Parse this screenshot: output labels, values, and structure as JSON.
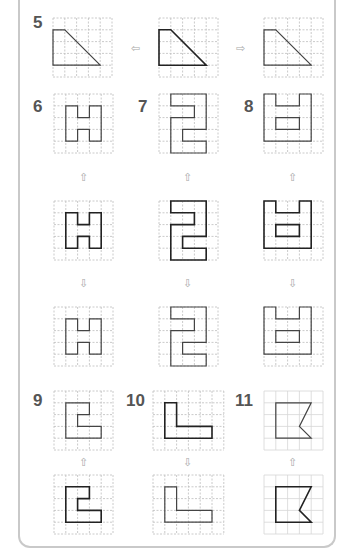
{
  "colors": {
    "frame": "#c9c9c9",
    "grid": "#bdbdbd",
    "shape": "#444444",
    "shape_bold": "#222222",
    "arrow": "#a8a8a8",
    "number": "#555555"
  },
  "problems": [
    {
      "number": "5",
      "x": 33,
      "y": 14
    },
    {
      "number": "6",
      "x": 33,
      "y": 98
    },
    {
      "number": "7",
      "x": 138,
      "y": 98
    },
    {
      "number": "8",
      "x": 244,
      "y": 98
    },
    {
      "number": "9",
      "x": 33,
      "y": 392
    },
    {
      "number": "10",
      "x": 126,
      "y": 392
    },
    {
      "number": "11",
      "x": 235,
      "y": 392
    }
  ],
  "grids": [
    {
      "id": "p5-left",
      "x": 53,
      "y": 18,
      "cols": 5,
      "rows": 5,
      "style": "dashed",
      "bold": false,
      "points": [
        [
          0,
          1
        ],
        [
          1,
          1
        ],
        [
          4,
          4
        ],
        [
          0,
          4
        ]
      ]
    },
    {
      "id": "p5-center",
      "x": 159,
      "y": 18,
      "cols": 5,
      "rows": 5,
      "style": "dashed",
      "bold": true,
      "points": [
        [
          0,
          1
        ],
        [
          1,
          1
        ],
        [
          4,
          4
        ],
        [
          0,
          4
        ]
      ]
    },
    {
      "id": "p5-right",
      "x": 264,
      "y": 18,
      "cols": 5,
      "rows": 5,
      "style": "dashed",
      "bold": false,
      "points": [
        [
          0,
          1
        ],
        [
          1,
          1
        ],
        [
          4,
          4
        ],
        [
          0,
          4
        ]
      ]
    },
    {
      "id": "p6-top",
      "x": 54,
      "y": 94,
      "cols": 5,
      "rows": 5,
      "style": "dashed",
      "bold": false,
      "points": [
        [
          1,
          1
        ],
        [
          2,
          1
        ],
        [
          2,
          2
        ],
        [
          3,
          2
        ],
        [
          3,
          1
        ],
        [
          4,
          1
        ],
        [
          4,
          4
        ],
        [
          3,
          4
        ],
        [
          3,
          3
        ],
        [
          2,
          3
        ],
        [
          2,
          4
        ],
        [
          1,
          4
        ]
      ]
    },
    {
      "id": "p7-top",
      "x": 159,
      "y": 94,
      "cols": 5,
      "rows": 5,
      "style": "dashed",
      "bold": false,
      "points": [
        [
          1,
          0
        ],
        [
          4,
          0
        ],
        [
          4,
          3
        ],
        [
          2,
          3
        ],
        [
          2,
          4
        ],
        [
          4,
          4
        ],
        [
          4,
          5
        ],
        [
          1,
          5
        ],
        [
          1,
          2
        ],
        [
          3,
          2
        ],
        [
          3,
          1
        ],
        [
          1,
          1
        ]
      ]
    },
    {
      "id": "p8-top",
      "x": 264,
      "y": 94,
      "cols": 5,
      "rows": 5,
      "style": "dashed",
      "bold": false,
      "points": [
        [
          0,
          0
        ],
        [
          1,
          0
        ],
        [
          1,
          1
        ],
        [
          3,
          1
        ],
        [
          3,
          0
        ],
        [
          4,
          0
        ],
        [
          4,
          4
        ],
        [
          0,
          4
        ]
      ],
      "inner": [
        [
          1,
          2
        ],
        [
          3,
          2
        ],
        [
          3,
          3
        ],
        [
          1,
          3
        ]
      ]
    },
    {
      "id": "p6-mid",
      "x": 54,
      "y": 201,
      "cols": 5,
      "rows": 5,
      "style": "dashed",
      "bold": true,
      "points": [
        [
          1,
          1
        ],
        [
          2,
          1
        ],
        [
          2,
          2
        ],
        [
          3,
          2
        ],
        [
          3,
          1
        ],
        [
          4,
          1
        ],
        [
          4,
          4
        ],
        [
          3,
          4
        ],
        [
          3,
          3
        ],
        [
          2,
          3
        ],
        [
          2,
          4
        ],
        [
          1,
          4
        ]
      ]
    },
    {
      "id": "p7-mid",
      "x": 159,
      "y": 201,
      "cols": 5,
      "rows": 5,
      "style": "dashed",
      "bold": true,
      "points": [
        [
          1,
          0
        ],
        [
          4,
          0
        ],
        [
          4,
          3
        ],
        [
          2,
          3
        ],
        [
          2,
          4
        ],
        [
          4,
          4
        ],
        [
          4,
          5
        ],
        [
          1,
          5
        ],
        [
          1,
          2
        ],
        [
          3,
          2
        ],
        [
          3,
          1
        ],
        [
          1,
          1
        ]
      ]
    },
    {
      "id": "p8-mid",
      "x": 264,
      "y": 201,
      "cols": 5,
      "rows": 5,
      "style": "dashed",
      "bold": true,
      "points": [
        [
          0,
          0
        ],
        [
          1,
          0
        ],
        [
          1,
          1
        ],
        [
          3,
          1
        ],
        [
          3,
          0
        ],
        [
          4,
          0
        ],
        [
          4,
          4
        ],
        [
          0,
          4
        ]
      ],
      "inner": [
        [
          1,
          2
        ],
        [
          3,
          2
        ],
        [
          3,
          3
        ],
        [
          1,
          3
        ]
      ]
    },
    {
      "id": "p6-bot",
      "x": 54,
      "y": 307,
      "cols": 5,
      "rows": 5,
      "style": "dashed",
      "bold": false,
      "points": [
        [
          1,
          1
        ],
        [
          2,
          1
        ],
        [
          2,
          2
        ],
        [
          3,
          2
        ],
        [
          3,
          1
        ],
        [
          4,
          1
        ],
        [
          4,
          4
        ],
        [
          3,
          4
        ],
        [
          3,
          3
        ],
        [
          2,
          3
        ],
        [
          2,
          4
        ],
        [
          1,
          4
        ]
      ]
    },
    {
      "id": "p7-bot",
      "x": 159,
      "y": 307,
      "cols": 5,
      "rows": 5,
      "style": "dashed",
      "bold": false,
      "points": [
        [
          1,
          0
        ],
        [
          4,
          0
        ],
        [
          4,
          3
        ],
        [
          2,
          3
        ],
        [
          2,
          4
        ],
        [
          4,
          4
        ],
        [
          4,
          5
        ],
        [
          1,
          5
        ],
        [
          1,
          2
        ],
        [
          3,
          2
        ],
        [
          3,
          1
        ],
        [
          1,
          1
        ]
      ]
    },
    {
      "id": "p8-bot",
      "x": 264,
      "y": 307,
      "cols": 5,
      "rows": 5,
      "style": "dashed",
      "bold": false,
      "points": [
        [
          0,
          0
        ],
        [
          1,
          0
        ],
        [
          1,
          1
        ],
        [
          3,
          1
        ],
        [
          3,
          0
        ],
        [
          4,
          0
        ],
        [
          4,
          4
        ],
        [
          0,
          4
        ]
      ],
      "inner": [
        [
          1,
          2
        ],
        [
          3,
          2
        ],
        [
          3,
          3
        ],
        [
          1,
          3
        ]
      ]
    },
    {
      "id": "p9-top",
      "x": 54,
      "y": 391,
      "cols": 5,
      "rows": 5,
      "style": "dashed",
      "bold": false,
      "points": [
        [
          1,
          1
        ],
        [
          3,
          1
        ],
        [
          3,
          2
        ],
        [
          2,
          2
        ],
        [
          2,
          3
        ],
        [
          4,
          3
        ],
        [
          4,
          4
        ],
        [
          1,
          4
        ]
      ]
    },
    {
      "id": "p10-top",
      "x": 153,
      "y": 391,
      "cols": 6,
      "rows": 5,
      "style": "dashed",
      "bold": true,
      "points": [
        [
          1,
          1
        ],
        [
          2,
          1
        ],
        [
          2,
          3
        ],
        [
          5,
          3
        ],
        [
          5,
          4
        ],
        [
          1,
          4
        ]
      ]
    },
    {
      "id": "p11-top",
      "x": 264,
      "y": 391,
      "cols": 5,
      "rows": 5,
      "style": "solid",
      "bold": false,
      "points": [
        [
          1,
          1
        ],
        [
          4,
          1
        ],
        [
          3,
          3
        ],
        [
          4,
          4
        ],
        [
          1,
          4
        ]
      ]
    },
    {
      "id": "p9-bot",
      "x": 54,
      "y": 475,
      "cols": 5,
      "rows": 5,
      "style": "dashed",
      "bold": true,
      "points": [
        [
          1,
          1
        ],
        [
          3,
          1
        ],
        [
          3,
          2
        ],
        [
          2,
          2
        ],
        [
          2,
          3
        ],
        [
          4,
          3
        ],
        [
          4,
          4
        ],
        [
          1,
          4
        ]
      ]
    },
    {
      "id": "p10-bot",
      "x": 153,
      "y": 475,
      "cols": 6,
      "rows": 5,
      "style": "dashed",
      "bold": false,
      "points": [
        [
          1,
          1
        ],
        [
          2,
          1
        ],
        [
          2,
          3
        ],
        [
          5,
          3
        ],
        [
          5,
          4
        ],
        [
          1,
          4
        ]
      ]
    },
    {
      "id": "p11-bot",
      "x": 264,
      "y": 475,
      "cols": 5,
      "rows": 5,
      "style": "solid",
      "bold": true,
      "points": [
        [
          1,
          1
        ],
        [
          4,
          1
        ],
        [
          3,
          3
        ],
        [
          4,
          4
        ],
        [
          1,
          4
        ]
      ]
    }
  ],
  "arrows": [
    {
      "id": "p5-arrow-left",
      "glyph": "⇦",
      "x": 131,
      "y": 43
    },
    {
      "id": "p5-arrow-right",
      "glyph": "⇨",
      "x": 236,
      "y": 43
    },
    {
      "id": "p6-arrow-up",
      "glyph": "⇧",
      "x": 79,
      "y": 172
    },
    {
      "id": "p7-arrow-up",
      "glyph": "⇧",
      "x": 183,
      "y": 172
    },
    {
      "id": "p8-arrow-up",
      "glyph": "⇧",
      "x": 288,
      "y": 172
    },
    {
      "id": "p6-arrow-down",
      "glyph": "⇩",
      "x": 79,
      "y": 278
    },
    {
      "id": "p7-arrow-down",
      "glyph": "⇩",
      "x": 183,
      "y": 278
    },
    {
      "id": "p8-arrow-down",
      "glyph": "⇩",
      "x": 288,
      "y": 278
    },
    {
      "id": "p9-arrow-up",
      "glyph": "⇧",
      "x": 79,
      "y": 457
    },
    {
      "id": "p10-arrow-down",
      "glyph": "⇩",
      "x": 183,
      "y": 457
    },
    {
      "id": "p11-arrow-up",
      "glyph": "⇧",
      "x": 288,
      "y": 457
    }
  ],
  "cell_size": 11.8
}
